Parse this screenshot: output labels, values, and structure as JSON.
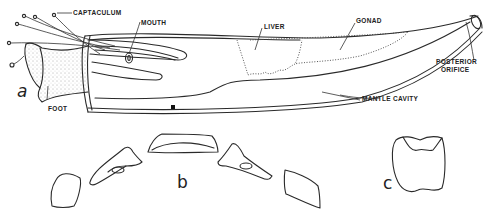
{
  "figure": {
    "panels": [
      {
        "id": "a",
        "label": "a",
        "description": "Scaphopod (tusk shell) whole animal, lateral view"
      },
      {
        "id": "b",
        "label": "b",
        "description": "Radula / jaw elements, disarticulated"
      },
      {
        "id": "c",
        "label": "c",
        "description": "Single tooth / plate"
      }
    ],
    "annotations": [
      {
        "id": "captaculum",
        "text": "CAPTACULUM"
      },
      {
        "id": "mouth",
        "text": "MOUTH"
      },
      {
        "id": "liver",
        "text": "LIVER"
      },
      {
        "id": "gonad",
        "text": "GONAD"
      },
      {
        "id": "posterior_orifice_1",
        "text": "POSTERIOR"
      },
      {
        "id": "posterior_orifice_2",
        "text": "ORIFICE"
      },
      {
        "id": "mantle_cavity",
        "text": "MANTLE CAVITY"
      },
      {
        "id": "foot",
        "text": "FOOT"
      }
    ]
  }
}
